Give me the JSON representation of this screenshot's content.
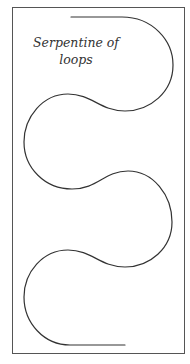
{
  "diagram": {
    "caption_line1": "Serpentine of",
    "caption_line2": "loops",
    "colors": {
      "background": "#ffffff",
      "frame": "#555555",
      "curve": "#333333",
      "text": "#333333"
    },
    "curve_path": "M71,17 L122,17 C152,17 173,40 173,65 C173,92 150,111 125,111 C100,111 92,94 68,94 C43,94 24,117 24,142 C24,168 45,189 72,189 C98,189 104,171 128,171 C153,171 172,195 172,222 C172,248 150,267 125,267 C100,267 92,250 68,250 C43,250 24,272 24,297 C24,323 44,345 70,345 L125,345"
  }
}
